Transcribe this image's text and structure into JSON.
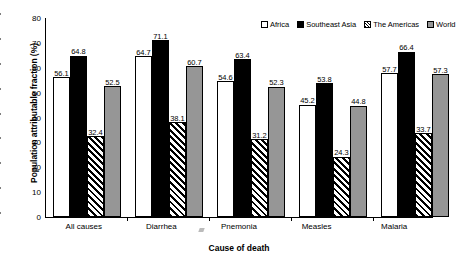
{
  "chart_data": {
    "type": "bar",
    "title": "",
    "xlabel": "Cause of death",
    "ylabel": "Population attributable fraction (%)",
    "ylim": [
      0,
      80
    ],
    "ytick_step": 10,
    "yticks": [
      "80",
      "70",
      "60",
      "50",
      "40",
      "30",
      "20",
      "10",
      "0"
    ],
    "grid": false,
    "legend_position": "top-right-inside",
    "categories": [
      "All causes",
      "Diarrhea",
      "Pnemonia",
      "Measles",
      "Malaria"
    ],
    "series": [
      {
        "name": "Africa",
        "swatch": "white-open",
        "color": "#ffffff",
        "values": [
          56.1,
          64.7,
          54.6,
          45.2,
          57.7
        ],
        "labels": [
          "56.1",
          "64.7",
          "54.6",
          "45.2",
          "57.7"
        ]
      },
      {
        "name": "Southeast Asia",
        "swatch": "black-solid",
        "color": "#000000",
        "values": [
          64.8,
          71.1,
          63.4,
          53.8,
          66.4
        ],
        "labels": [
          "64.8",
          "71.1",
          "63.4",
          "53.8",
          "66.4"
        ]
      },
      {
        "name": "The Americas",
        "swatch": "diagonal-hatch",
        "color": "#ffffff",
        "values": [
          32.4,
          38.1,
          31.2,
          24.3,
          33.7
        ],
        "labels": [
          "32.4",
          "38.1",
          "31.2",
          "24.3",
          "33.7"
        ]
      },
      {
        "name": "World",
        "swatch": "gray-solid",
        "color": "#969696",
        "values": [
          52.5,
          60.7,
          52.3,
          44.8,
          57.3
        ],
        "labels": [
          "52.5",
          "60.7",
          "52.3",
          "44.8",
          "57.3"
        ]
      }
    ]
  }
}
